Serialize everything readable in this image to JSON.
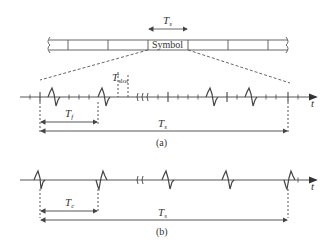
{
  "diagram": {
    "frame_structure": {
      "symbol_label": "Symbol",
      "symbol_duration_label": "T",
      "symbol_duration_sub": "s",
      "slot_label": "T",
      "slot_sub": "slot"
    },
    "panel_a": {
      "caption": "(a)",
      "axis_label": "t",
      "frame_label": "T",
      "frame_sub": "f",
      "symbol_label": "T",
      "symbol_sub": "s"
    },
    "panel_b": {
      "caption": "(b)",
      "axis_label": "t",
      "chip_label": "T",
      "chip_sub": "c",
      "symbol_label": "T",
      "symbol_sub": "s"
    },
    "colors": {
      "line": "#444444",
      "text": "#333333"
    }
  }
}
